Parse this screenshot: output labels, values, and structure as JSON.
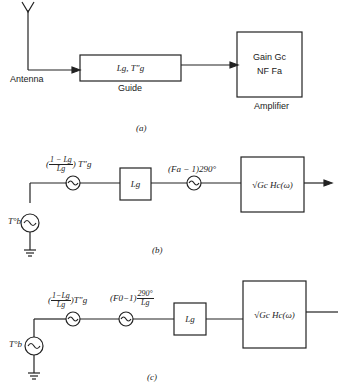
{
  "diagram_a": {
    "caption": "(a)",
    "antenna_label": "Antenna",
    "guide_box_text": "Lg, T\"g",
    "guide_label": "Guide",
    "amplifier_line1": "Gain Gc",
    "amplifier_line2": "NF Fa",
    "amplifier_label": "Amplifier"
  },
  "diagram_b": {
    "caption": "(b)",
    "source_label": "T°b",
    "source1_num": "1 − Lg",
    "source1_den": "Lg",
    "source1_suffix": "T\"g",
    "loss_box": "Lg",
    "source2_label": "(Fa − 1)290°",
    "amp_box": "√Gc Hc(ω)"
  },
  "diagram_c": {
    "caption": "(c)",
    "source_label": "T°b",
    "source1_num": "1−Lg",
    "source1_den": "Lg",
    "source1_suffix": "T\"g",
    "source2_prefix": "(F0−1)",
    "source2_num": "290°",
    "source2_den": "Lg",
    "loss_box": "Lg",
    "amp_box": "√Gc Hc(ω)"
  }
}
